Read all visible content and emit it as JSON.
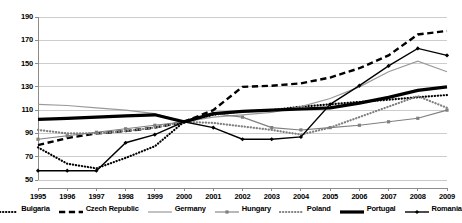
{
  "chart_data": {
    "type": "line",
    "title": "",
    "subtitle": "",
    "xlabel": "",
    "ylabel": "",
    "grid": true,
    "legend_position": "bottom",
    "xlim": [
      1995,
      2009
    ],
    "ylim": [
      50,
      190
    ],
    "ytick_step": 20,
    "yticks": [
      50,
      70,
      90,
      110,
      130,
      150,
      170,
      190
    ],
    "categories": [
      1995,
      1996,
      1997,
      1998,
      1999,
      2000,
      2001,
      2002,
      2003,
      2004,
      2005,
      2006,
      2007,
      2008,
      2009
    ],
    "xticklabels": [
      "1995",
      "1996",
      "1997",
      "1998",
      "1999",
      "2000",
      "2001",
      "2002",
      "2003",
      "2004",
      "2005",
      "2006",
      "2007",
      "2008",
      "2009"
    ],
    "yticklabels": [
      "50",
      "70",
      "90",
      "110",
      "130",
      "150",
      "170",
      "190"
    ],
    "series": [
      {
        "name": "Bulgaria",
        "color": "#000000",
        "style": "dotted",
        "width": 2.2,
        "marker": "none",
        "values": [
          78,
          64,
          60,
          69,
          79,
          100,
          106,
          109,
          110,
          113,
          115,
          117,
          119,
          121,
          123
        ]
      },
      {
        "name": "Czech Republic",
        "color": "#000000",
        "style": "dashed",
        "width": 2.4,
        "marker": "none",
        "values": [
          80,
          86,
          90,
          92,
          95,
          100,
          110,
          130,
          131,
          133,
          138,
          146,
          157,
          175,
          178
        ]
      },
      {
        "name": "Germany",
        "color": "#9a9a9a",
        "style": "solid",
        "width": 1.2,
        "marker": "none",
        "values": [
          115,
          114,
          112,
          110,
          107,
          100,
          104,
          106,
          108,
          113,
          120,
          130,
          143,
          152,
          143
        ]
      },
      {
        "name": "Hungary",
        "color": "#7f7f7f",
        "style": "solid",
        "width": 1.1,
        "marker": "square",
        "values": [
          85,
          88,
          91,
          94,
          97,
          100,
          107,
          104,
          95,
          93,
          95,
          97,
          100,
          103,
          110
        ]
      },
      {
        "name": "Poland",
        "color": "#808080",
        "style": "dotted",
        "width": 2.2,
        "marker": "none",
        "values": [
          93,
          90,
          90,
          92,
          95,
          100,
          99,
          96,
          93,
          89,
          95,
          104,
          113,
          122,
          112
        ]
      },
      {
        "name": "Portugal",
        "color": "#000000",
        "style": "solid",
        "width": 3.2,
        "marker": "none",
        "values": [
          102,
          103,
          104,
          105,
          106,
          100,
          107,
          109,
          110,
          111,
          112,
          116,
          121,
          127,
          130
        ]
      },
      {
        "name": "Romania",
        "color": "#000000",
        "style": "solid",
        "width": 1.4,
        "marker": "diamond",
        "values": [
          58,
          58,
          58,
          82,
          89,
          100,
          95,
          85,
          85,
          87,
          115,
          131,
          148,
          163,
          157
        ]
      }
    ]
  },
  "legend": {
    "items": [
      {
        "label": "Bulgaria",
        "key": "dotted-black"
      },
      {
        "label": "Czech Republic",
        "key": "dashed-black"
      },
      {
        "label": "Germany",
        "key": "solid-gray"
      },
      {
        "label": "Hungary",
        "key": "solid-gray-marker"
      },
      {
        "label": "Poland",
        "key": "dotted-gray"
      },
      {
        "label": "Portugal",
        "key": "solid-black-thick"
      },
      {
        "label": "Romania",
        "key": "solid-black-marker"
      }
    ]
  },
  "axes": {
    "gridline_color": "#c8c8c8",
    "axis_color": "#8c8c8c",
    "background": "#ffffff"
  }
}
